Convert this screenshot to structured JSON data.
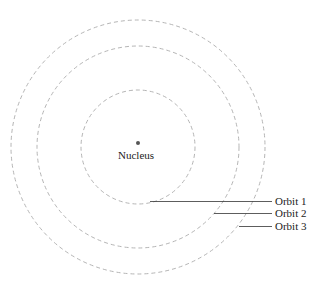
{
  "diagram": {
    "nucleus_label": "Nucleus",
    "orbits": [
      {
        "label": "Orbit 1"
      },
      {
        "label": "Orbit 2"
      },
      {
        "label": "Orbit 3"
      }
    ],
    "colors": {
      "orbit": "#b5b5b5",
      "leader": "#333333",
      "nucleus": "#555555"
    }
  }
}
